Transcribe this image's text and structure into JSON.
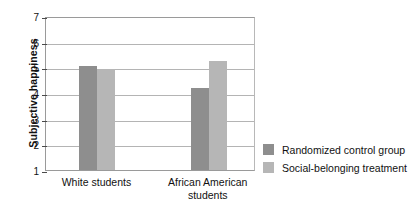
{
  "chart_data": {
    "type": "bar",
    "title": "",
    "xlabel": "",
    "ylabel": "Subjective happiness",
    "ylim": [
      1,
      7
    ],
    "yticks": [
      1,
      2,
      3,
      4,
      5,
      6,
      7
    ],
    "grid": true,
    "legend_position": "right",
    "categories": [
      "White students",
      "African American students"
    ],
    "series": [
      {
        "name": "Randomized control group",
        "color": "#8e8e8e",
        "values": [
          5.05,
          4.2
        ]
      },
      {
        "name": "Social-belonging treatment",
        "color": "#b6b6b6",
        "values": [
          4.95,
          5.25
        ]
      }
    ]
  },
  "axis": {
    "y_title": "Subjective happiness",
    "tick_labels": [
      "7",
      "6",
      "5",
      "4",
      "3",
      "2",
      "1"
    ]
  },
  "x_categories": [
    {
      "line1": "White students",
      "line2": ""
    },
    {
      "line1": "African American",
      "line2": "students"
    }
  ],
  "legend": {
    "items": [
      {
        "label": "Randomized control group",
        "swatch": "control"
      },
      {
        "label": "Social-belonging treatment",
        "swatch": "treatment"
      }
    ]
  }
}
